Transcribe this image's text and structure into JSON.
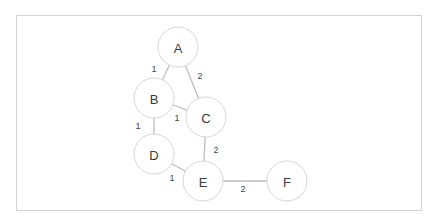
{
  "diagram": {
    "type": "weighted-undirected-graph",
    "colors": {
      "node_stroke": "#d6d6d6",
      "edge": "#bdbdbd",
      "text": "#3a3a3a",
      "frame": "#d4d4d4"
    },
    "nodes": [
      {
        "id": "A",
        "label": "A",
        "x": 178,
        "y": 47
      },
      {
        "id": "B",
        "label": "B",
        "x": 154,
        "y": 98
      },
      {
        "id": "C",
        "label": "C",
        "x": 206,
        "y": 117
      },
      {
        "id": "D",
        "label": "D",
        "x": 154,
        "y": 154
      },
      {
        "id": "E",
        "label": "E",
        "x": 203,
        "y": 181
      },
      {
        "id": "F",
        "label": "F",
        "x": 287,
        "y": 181
      }
    ],
    "edges": [
      {
        "from": "A",
        "to": "B",
        "weight": "1",
        "lx": 154,
        "ly": 69
      },
      {
        "from": "A",
        "to": "C",
        "weight": "2",
        "lx": 200,
        "ly": 76
      },
      {
        "from": "B",
        "to": "C",
        "weight": "1",
        "lx": 177,
        "ly": 118
      },
      {
        "from": "B",
        "to": "D",
        "weight": "1",
        "lx": 138,
        "ly": 126
      },
      {
        "from": "C",
        "to": "E",
        "weight": "2",
        "lx": 216,
        "ly": 150
      },
      {
        "from": "D",
        "to": "E",
        "weight": "1",
        "lx": 172,
        "ly": 178
      },
      {
        "from": "E",
        "to": "F",
        "weight": "2",
        "lx": 243,
        "ly": 189
      }
    ]
  }
}
